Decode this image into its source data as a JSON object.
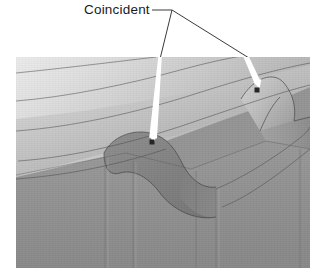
{
  "annotation": {
    "label": "Coincident",
    "label_x": 84,
    "label_y": 2,
    "text_color": "#1a1a1a"
  },
  "leader": {
    "junction": {
      "x": 172,
      "y": 10
    },
    "black_line_left_end": {
      "x": 160,
      "y": 59
    },
    "black_line_right_end": {
      "x": 248,
      "y": 57
    },
    "color": "#3a3a3a",
    "width": 1
  },
  "arrows": [
    {
      "name": "arrow-to-left-coincident-point",
      "from": {
        "x": 161,
        "y": 57
      },
      "to": {
        "x": 152,
        "y": 141
      },
      "color": "#ffffff"
    },
    {
      "name": "arrow-to-right-coincident-point",
      "from": {
        "x": 247,
        "y": 57
      },
      "to": {
        "x": 258,
        "y": 88
      },
      "color": "#ffffff"
    }
  ],
  "markers": [
    {
      "name": "coincident-marker-left",
      "x": 152,
      "y": 142,
      "size": 5,
      "color": "#262626"
    },
    {
      "name": "coincident-marker-right",
      "x": 257,
      "y": 90,
      "size": 5,
      "color": "#262626"
    }
  ],
  "viewport": {
    "x": 16,
    "y": 57,
    "width": 294,
    "height": 211,
    "background": "#9a9a9a",
    "description": "Shaded 3D CAD solid model showing a swept curved top surface meeting a vertical side wall with a filleted S-shaped notch"
  },
  "model": {
    "top_surface_light": "#e4e4e4",
    "top_surface_mid": "#c2c2c2",
    "top_surface_dark": "#a6a6a6",
    "side_wall": "#8f8f8f",
    "side_wall_dark": "#7d7d7d",
    "notch_fillet": "#8a8a8a",
    "notch_fillet_dark": "#767676",
    "edge_line_color": "#4a4a4a"
  }
}
